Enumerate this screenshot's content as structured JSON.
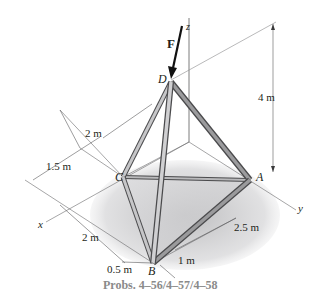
{
  "figure": {
    "caption": "Probs. 4–56/4–57/4–58",
    "force_label": "F",
    "points": {
      "A": "A",
      "B": "B",
      "C": "C",
      "D": "D"
    },
    "axes": {
      "x": "x",
      "y": "y",
      "z": "z"
    },
    "dimensions": {
      "height": "4 m",
      "d_to_c_offset": "2 m",
      "c_x_offset": "1.5 m",
      "x_span_b": "2 m",
      "b_offset": "0.5 m",
      "b_y_offset": "1 m",
      "a_y_span": "2.5 m"
    },
    "colors": {
      "member_fill": "#b9b9bb",
      "member_edge": "#4a4a4c",
      "shadow": "#c7c7c9",
      "line": "#3a3a3c",
      "caption": "#8a8a8a"
    }
  }
}
